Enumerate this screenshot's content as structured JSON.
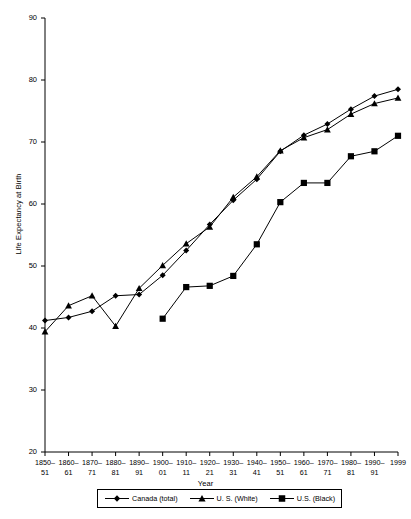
{
  "chart_data": {
    "type": "line",
    "title": "",
    "xlabel": "Year",
    "ylabel": "Life Expectancy at Birth",
    "ylim": [
      20,
      90
    ],
    "yticks": [
      20,
      30,
      40,
      50,
      60,
      70,
      80,
      90
    ],
    "grid": false,
    "legend_position": "bottom-center",
    "categories": [
      "1850-51",
      "1860-61",
      "1870-71",
      "1880-81",
      "1890-91",
      "1900-01",
      "1910-11",
      "1920-21",
      "1930-31",
      "1940-41",
      "1950-51",
      "1960-61",
      "1970-71",
      "1980-81",
      "1990-91",
      "1999"
    ],
    "tick_labels": [
      {
        "line1": "1850–",
        "line2": "51"
      },
      {
        "line1": "1860–",
        "line2": "61"
      },
      {
        "line1": "1870–",
        "line2": "71"
      },
      {
        "line1": "1880–",
        "line2": "81"
      },
      {
        "line1": "1890–",
        "line2": "91"
      },
      {
        "line1": "1900–",
        "line2": "01"
      },
      {
        "line1": "1910–",
        "line2": "11"
      },
      {
        "line1": "1920–",
        "line2": "21"
      },
      {
        "line1": "1930–",
        "line2": "31"
      },
      {
        "line1": "1940–",
        "line2": "41"
      },
      {
        "line1": "1950–",
        "line2": "51"
      },
      {
        "line1": "1960–",
        "line2": "61"
      },
      {
        "line1": "1970–",
        "line2": "71"
      },
      {
        "line1": "1980–",
        "line2": "81"
      },
      {
        "line1": "1990–",
        "line2": "91"
      },
      {
        "line1": "1999",
        "line2": ""
      }
    ],
    "series": [
      {
        "name": "Canada (total)",
        "marker": "diamond",
        "color": "#000000",
        "values": [
          41.2,
          41.7,
          42.7,
          45.2,
          45.4,
          48.5,
          52.5,
          56.7,
          60.6,
          64.0,
          68.5,
          71.1,
          72.9,
          75.3,
          77.4,
          78.5
        ]
      },
      {
        "name": "U. S. (White)",
        "marker": "triangle",
        "color": "#000000",
        "values": [
          39.4,
          43.6,
          45.2,
          40.3,
          46.4,
          50.1,
          53.6,
          56.3,
          61.1,
          64.4,
          68.6,
          70.7,
          72.0,
          74.5,
          76.2,
          77.1
        ]
      },
      {
        "name": "U.S. (Black)",
        "marker": "square",
        "color": "#000000",
        "values": [
          null,
          null,
          null,
          null,
          null,
          41.5,
          46.6,
          46.8,
          48.4,
          53.5,
          60.3,
          63.4,
          63.4,
          67.7,
          68.5,
          71.0
        ]
      }
    ]
  },
  "axis": {
    "y_title": "Life Expectancy at Birth",
    "x_title": "Year"
  },
  "legend": {
    "items": [
      {
        "label": "Canada (total)",
        "marker": "diamond"
      },
      {
        "label": "U. S. (White)",
        "marker": "triangle"
      },
      {
        "label": "U.S. (Black)",
        "marker": "square"
      }
    ]
  }
}
